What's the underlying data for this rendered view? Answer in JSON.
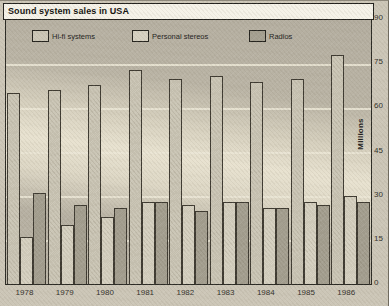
{
  "window": {
    "title": "Sound system sales in USA"
  },
  "chart_data": {
    "type": "bar",
    "title": "Sound system sales in USA",
    "categories": [
      "1978",
      "1979",
      "1980",
      "1981",
      "1982",
      "1983",
      "1984",
      "1985",
      "1986"
    ],
    "series": [
      {
        "name": "Hi-fi systems",
        "color": "#cbc6b6",
        "values": [
          65,
          66,
          68,
          73,
          70,
          71,
          69,
          70,
          78
        ]
      },
      {
        "name": "Personal stereos",
        "color": "#d6d1c1",
        "values": [
          16,
          20,
          23,
          28,
          27,
          28,
          26,
          28,
          30
        ]
      },
      {
        "name": "Radios",
        "color": "#a5a091",
        "values": [
          31,
          27,
          26,
          28,
          25,
          28,
          26,
          27,
          28
        ]
      }
    ],
    "xlabel": "",
    "ylabel": "Millions",
    "ylim": [
      0,
      90
    ],
    "yticks": [
      0,
      15,
      30,
      45,
      60,
      75,
      90
    ],
    "axis_labels_side": "right",
    "grid": "horizontal",
    "gridline_color": "#ebe6d6",
    "legend_position": "top-inside",
    "background_color": "#ccc6b7",
    "plot_band_light": "#e8e2d0",
    "plot_band_dark": "#b6b0a2"
  }
}
